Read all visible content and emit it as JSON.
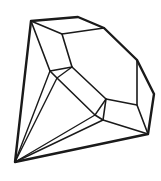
{
  "image": {
    "subject": "diamond-line-drawing",
    "alt": "Black outline line drawing of a faceted diamond gem",
    "colors": {
      "background": "#ffffff",
      "stroke": "#1a1a1a"
    }
  }
}
